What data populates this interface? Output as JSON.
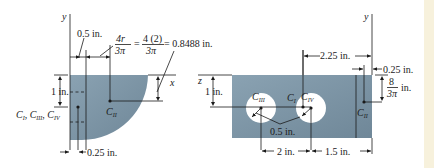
{
  "figure": {
    "left": {
      "axis_y": "y",
      "axis_x": "x",
      "dim_top_small": "0.5 in.",
      "formula_num1": "4r",
      "formula_den1": "3π",
      "formula_eq1": "=",
      "formula_num2": "4 (2)",
      "formula_den2": "3π",
      "formula_result": "= 0.8488 in.",
      "dim_left": "1 in.",
      "dim_bottom": "0.25 in.",
      "centroid_label_main": "C",
      "centroid_subs": [
        "I",
        "III",
        "IV"
      ],
      "centroid_ii_main": "C",
      "centroid_ii_sub": "II"
    },
    "right": {
      "axis_y": "y",
      "axis_z": "z",
      "dim_top": "2.25 in.",
      "dim_top_right": "0.25 in.",
      "dim_right_num": "8",
      "dim_right_den": "3π",
      "dim_right_unit": "in.",
      "dim_left": "1 in.",
      "hole_radius": "0.5 in.",
      "dim_bottom_left": "2 in.",
      "dim_bottom_right": "1.5 in.",
      "c1_main": "C",
      "c1_sub": "I",
      "c3_main": "C",
      "c3_sub": "III",
      "c4_main": "C",
      "c4_sub": "IV",
      "c2_main": "C",
      "c2_sub": "II"
    },
    "colors": {
      "plate_fill": "#7d95a6",
      "hole_fill": "#ffffff",
      "line": "#1a1a1a",
      "edge_strip": "#f7f1dc"
    }
  }
}
